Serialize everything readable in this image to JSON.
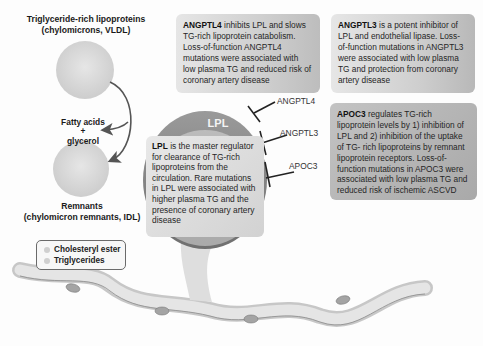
{
  "lipoproteins": {
    "top_label_line1": "Triglyceride-rich lipoproteins",
    "top_label_line2": "(chylomicrons, VLDL)",
    "products_line1": "Fatty acids",
    "products_plus": "+",
    "products_line2": "glycerol",
    "remnant_label_line1": "Remnants",
    "remnant_label_line2": "(chylomicron remnants, IDL)"
  },
  "legend": {
    "items": [
      {
        "label": "Cholesteryl ester",
        "color": "#cfcfcf"
      },
      {
        "label": "Triglycerides",
        "color": "#cfcfcf"
      }
    ]
  },
  "lpl": {
    "title": "LPL",
    "text_bold": "LPL",
    "text": " is the master regulator for clearance of TG-rich lipoproteins from the circulation. Rare mutations in LPL were associated with higher plasma TG and the presence of coronary artery disease"
  },
  "inhibitors": [
    {
      "label": "ANGPTL4"
    },
    {
      "label": "ANGPTL3"
    },
    {
      "label": "APOC3"
    }
  ],
  "boxes": {
    "angptl4": {
      "bold": "ANGPTL4",
      "text": " inhibits LPL and slows TG-rich lipoprotein catabolism. Loss-of-function ANGPTL4 mutations were associated with low plasma TG and reduced risk of coronary artery disease"
    },
    "angptl3": {
      "bold": "ANGPTL3",
      "text": " is a potent inhibitor of LPL and endothelial lipase. Loss-of-function mutations in ANGPTL3 were associated with low plasma TG and protection from coronary artery disease"
    },
    "apoc3": {
      "bold": "APOC3",
      "text": " regulates TG-rich lipoprotein levels by 1) inhibition of LPL and 2) inhibition of the uptake of TG- rich lipoproteins by remnant lipoprotein receptors. Loss-of-function mutations in APOC3 were associated with low plasma TG and reduced risk of ischemic ASCVD"
    }
  },
  "colors": {
    "lpl_ring": "#8a8a8a",
    "particle": "#d9d9d9",
    "vessel": "#d0d0d0",
    "text": "#1a1a1a"
  }
}
